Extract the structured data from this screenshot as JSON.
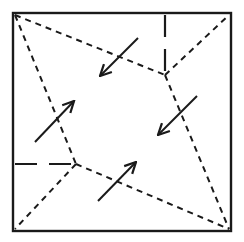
{
  "diagram": {
    "colors": {
      "stroke": "#1a1a1a",
      "background": "#ffffff"
    },
    "square": {
      "x1": 13,
      "y1": 13,
      "x2": 231,
      "y2": 231
    },
    "vertices": {
      "upper_right": [
        165,
        75
      ],
      "lower_left": [
        76,
        164
      ]
    },
    "short_dash_lines": [
      {
        "name": "top-left-to-upper-right",
        "from": [
          15,
          15
        ],
        "to": [
          165,
          75
        ]
      },
      {
        "name": "upper-right-to-top-right",
        "from": [
          165,
          75
        ],
        "to": [
          229,
          15
        ]
      },
      {
        "name": "upper-right-to-bottom-right",
        "from": [
          165,
          75
        ],
        "to": [
          229,
          229
        ]
      },
      {
        "name": "top-left-to-lower-left",
        "from": [
          15,
          15
        ],
        "to": [
          76,
          164
        ]
      },
      {
        "name": "lower-left-to-bottom-left",
        "from": [
          76,
          164
        ],
        "to": [
          15,
          229
        ]
      },
      {
        "name": "lower-left-to-bottom-right",
        "from": [
          76,
          164
        ],
        "to": [
          229,
          229
        ]
      }
    ],
    "long_dash_lines": [
      {
        "name": "top-edge-to-upper-right",
        "from": [
          165,
          15
        ],
        "to": [
          165,
          74
        ]
      },
      {
        "name": "left-edge-to-lower-left",
        "from": [
          15,
          164
        ],
        "to": [
          75,
          164
        ]
      }
    ],
    "arrows": [
      {
        "name": "arrow-top",
        "from": [
          138,
          38
        ],
        "to": [
          100,
          76
        ]
      },
      {
        "name": "arrow-right",
        "from": [
          197,
          96
        ],
        "to": [
          158,
          135
        ]
      },
      {
        "name": "arrow-left",
        "from": [
          35,
          142
        ],
        "to": [
          74,
          101
        ]
      },
      {
        "name": "arrow-bottom",
        "from": [
          98,
          201
        ],
        "to": [
          136,
          162
        ]
      }
    ]
  }
}
